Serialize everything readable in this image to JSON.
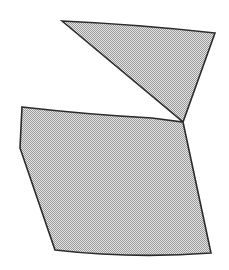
{
  "canvas": {
    "width": 229,
    "height": 270,
    "background_color": "#ffffff"
  },
  "figure": {
    "name": "concave-polygon",
    "fill_style": "dither-stipple-halftone",
    "fill_color": "#c6c6c6",
    "fill_dot_color": "#8c8c8c",
    "stroke_color": "#2b2b2b",
    "stroke_width": 1.6,
    "vertex_count": 8
  },
  "chart_data": {
    "type": "scatter",
    "title": "",
    "subtitle": "",
    "xlabel": "",
    "ylabel": "",
    "xlim": [
      0,
      229
    ],
    "ylim": [
      0,
      270
    ],
    "grid": false,
    "legend": false,
    "legend_position": "none",
    "annotations": [],
    "series": [
      {
        "name": "polygon-outline",
        "closed": true,
        "points": [
          [
            62,
            21
          ],
          [
            215,
            33
          ],
          [
            183,
            122
          ],
          [
            152,
            118
          ],
          [
            22,
            107
          ],
          [
            20,
            148
          ],
          [
            55,
            250
          ],
          [
            211,
            253
          ]
        ],
        "vertex_labels": [
          "top-left",
          "top-right",
          "right-notch-shoulder",
          "inner-concave-tip",
          "left-upper-notch",
          "left-lower-notch",
          "bottom-left",
          "bottom-right"
        ]
      }
    ],
    "edges": [
      {
        "from": "top-left",
        "to": "top-right",
        "curve": "slight-bow-up"
      },
      {
        "from": "top-right",
        "to": "right-notch-shoulder",
        "curve": "straight"
      },
      {
        "from": "right-notch-shoulder",
        "to": "inner-concave-tip",
        "curve": "straight"
      },
      {
        "from": "inner-concave-tip",
        "to": "left-upper-notch",
        "curve": "slight-bow-up"
      },
      {
        "from": "left-upper-notch",
        "to": "left-lower-notch",
        "curve": "straight"
      },
      {
        "from": "left-lower-notch",
        "to": "bottom-left",
        "curve": "straight"
      },
      {
        "from": "bottom-left",
        "to": "bottom-right",
        "curve": "slight-bow-down"
      },
      {
        "from": "bottom-right",
        "to": "right-notch-shoulder",
        "curve": "straight"
      }
    ],
    "path_d": "M 62 21 Q 139 24.5 215 33 L 183 122 L 152 118 Q 87 114.5 22 107 L 20 148 L 55 250 Q 133 259 211 253 L 183 122 Z"
  }
}
